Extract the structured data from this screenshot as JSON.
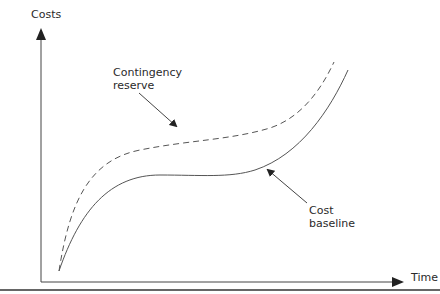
{
  "diagram": {
    "y_axis_label": "Costs",
    "x_axis_label": "Time",
    "annotations": {
      "contingency": [
        "Contingency",
        "reserve"
      ],
      "baseline": [
        "Cost",
        "baseline"
      ]
    },
    "curves": [
      {
        "name": "Cost baseline",
        "style": "solid"
      },
      {
        "name": "Contingency reserve",
        "style": "dashed"
      }
    ],
    "colors": {
      "line": "#555555",
      "axis": "#444444",
      "text": "#2a2a2a"
    }
  }
}
